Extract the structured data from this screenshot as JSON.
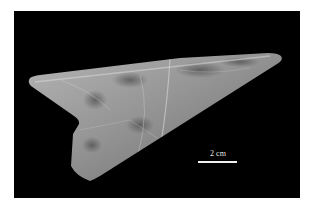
{
  "image": {
    "subject": "triangular translucent stone artifact on black background",
    "background_color": "#000000",
    "frame_color": "#ffffff",
    "artifact_base_color": "#9a9a9a"
  },
  "scale_bar": {
    "label": "2 cm"
  }
}
